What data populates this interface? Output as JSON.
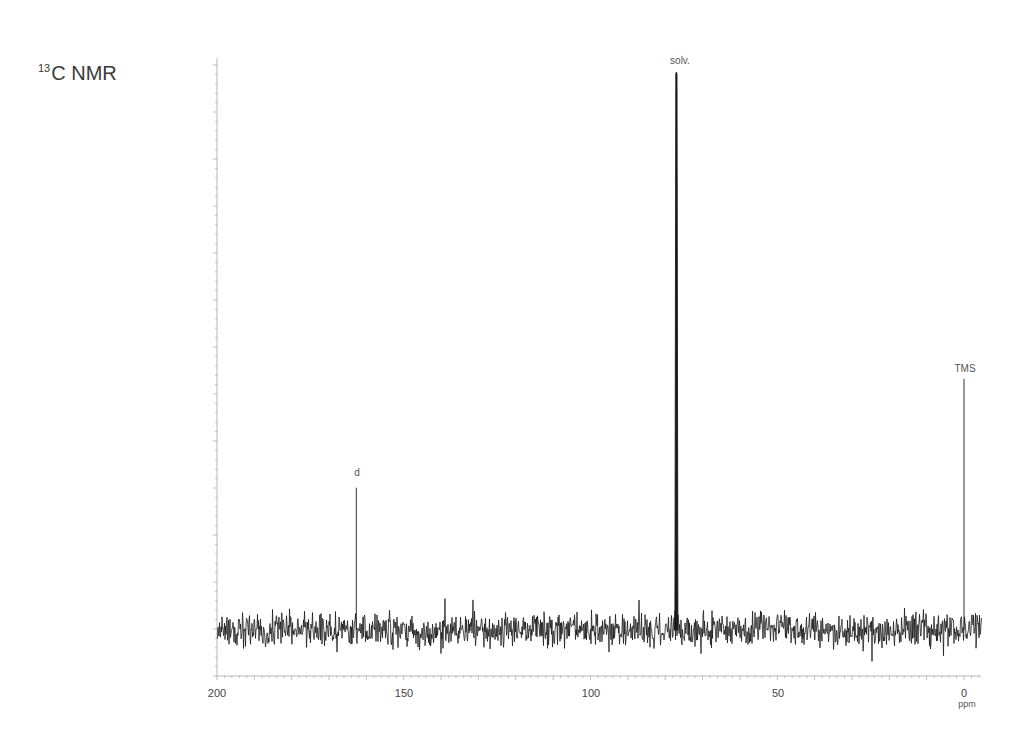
{
  "title": {
    "isotope_superscript": "13",
    "text": "C NMR"
  },
  "chart_data": {
    "type": "line",
    "title": "13C NMR",
    "xlabel": "ppm",
    "ylabel": "",
    "xlim": [
      200,
      0
    ],
    "x_reversed": true,
    "x_ticks": [
      200,
      150,
      100,
      50,
      0
    ],
    "x_tick_labels": [
      "200",
      "150",
      "100",
      "50",
      "0"
    ],
    "y_ticks_visible": true,
    "y_tick_labels": [],
    "grid": false,
    "legend": null,
    "baseline_noise": true,
    "x_data_extent_ppm": [
      200,
      -4.7
    ],
    "peaks": [
      {
        "label": "d",
        "ppm": 162.7,
        "relative_height": 0.255
      },
      {
        "label": "solv.",
        "ppm": 77.0,
        "relative_height": 1.0
      },
      {
        "label": "TMS",
        "ppm": 0.0,
        "relative_height": 0.45
      }
    ]
  },
  "axis": {
    "x_unit": "ppm",
    "x_tick_labels": [
      "200",
      "150",
      "100",
      "50",
      "0"
    ]
  },
  "peak_labels": {
    "d": "d",
    "solv": "solv.",
    "tms": "TMS"
  }
}
